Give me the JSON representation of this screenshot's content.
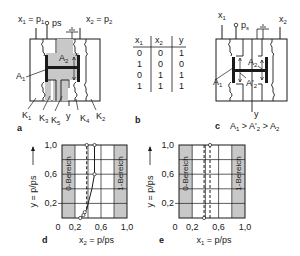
{
  "panel_a": {
    "label": "a",
    "input1": "x1 = p1",
    "input1_parts": {
      "x": "x",
      "x_sub": "1",
      "eq": " = p",
      "p_sub": "1"
    },
    "supply": "ps",
    "input2_parts": {
      "x": "x",
      "x_sub": "2",
      "eq": " = p",
      "p_sub": "2"
    },
    "area_A1": {
      "base": "A",
      "sub": "1"
    },
    "area_A2": {
      "base": "A",
      "sub": "2"
    },
    "chambers": [
      {
        "base": "K",
        "sub": "1"
      },
      {
        "base": "K",
        "sub": "3"
      },
      {
        "base": "K",
        "sub": "5"
      },
      {
        "base": "y",
        "sub": ""
      },
      {
        "base": "K",
        "sub": "4"
      },
      {
        "base": "K",
        "sub": "2"
      }
    ],
    "colors": {
      "fill": "#c8c8c8",
      "line": "#1a1a1a"
    }
  },
  "panel_b": {
    "label": "b",
    "table": {
      "headers": [
        {
          "base": "x",
          "sub": "1"
        },
        {
          "base": "x",
          "sub": "2"
        },
        {
          "base": "y",
          "sub": ""
        }
      ],
      "rows": [
        [
          "0",
          "0",
          "1"
        ],
        [
          "1",
          "0",
          "0"
        ],
        [
          "0",
          "1",
          "1"
        ],
        [
          "1",
          "1",
          "1"
        ]
      ]
    }
  },
  "panel_c": {
    "label": "c",
    "input1": {
      "base": "x",
      "sub": "1"
    },
    "supply": {
      "base": "p",
      "sub": "s"
    },
    "input2": {
      "base": "x",
      "sub": "2"
    },
    "output": "y",
    "area_A1": {
      "base": "A",
      "sub": "1"
    },
    "area_A2": {
      "base": "A",
      "sub": "2"
    },
    "area_A2p": {
      "base": "A'",
      "sub": "2"
    },
    "caption": "A1 > A'2 > A2",
    "caption_parts": [
      "A",
      "1",
      " > A'",
      "2",
      " > A",
      "2"
    ]
  },
  "chart_data": [
    {
      "id": "d",
      "type": "line",
      "title": "",
      "panel_label": "d",
      "xlabel": "x2 = p/ps",
      "xlabel_parts": {
        "base": "x",
        "sub": "2",
        "rest": " = p/ps"
      },
      "ylabel": "y = p/ps",
      "xlim": [
        0,
        1.0
      ],
      "ylim": [
        0,
        1.0
      ],
      "x_ticks": [
        "0",
        "0,2",
        "0,6",
        "1,0"
      ],
      "y_ticks": [
        "0,2",
        "0,6",
        "1,0"
      ],
      "grid": true,
      "regions": [
        {
          "label": "0-Bereich",
          "x_range": [
            0.0,
            0.2
          ],
          "color": "#c8c8c8"
        },
        {
          "label": "1-Bereich",
          "x_range": [
            0.8,
            1.0
          ],
          "color": "#c8c8c8"
        }
      ],
      "series": [
        {
          "name": "rising",
          "style": "solid",
          "x": [
            0.28,
            0.33,
            0.38,
            0.46,
            0.5,
            0.5
          ],
          "y": [
            0.0,
            0.04,
            0.12,
            0.4,
            0.6,
            1.0
          ]
        },
        {
          "name": "hysteresis-left",
          "style": "dashed",
          "x": [
            0.38,
            0.38
          ],
          "y": [
            0.12,
            1.0
          ]
        },
        {
          "name": "hysteresis-right",
          "style": "dashed",
          "x": [
            0.5,
            0.5
          ],
          "y": [
            0.6,
            1.0
          ]
        }
      ],
      "markers": [
        {
          "x": 0.28,
          "y": 0.0
        },
        {
          "x": 0.33,
          "y": 0.04
        },
        {
          "x": 0.35,
          "y": 0.08
        },
        {
          "x": 0.5,
          "y": 0.6
        },
        {
          "x": 0.38,
          "y": 1.0
        },
        {
          "x": 0.5,
          "y": 1.0
        }
      ]
    },
    {
      "id": "e",
      "type": "line",
      "title": "",
      "panel_label": "e",
      "xlabel": "x1 = p/ps",
      "xlabel_parts": {
        "base": "x",
        "sub": "1",
        "rest": " = p/ps"
      },
      "ylabel": "y = p/ps",
      "xlim": [
        0,
        1.0
      ],
      "ylim": [
        0,
        1.0
      ],
      "x_ticks": [
        "0",
        "0,2",
        "0,6",
        "1,0"
      ],
      "y_ticks": [
        "0,2",
        "0,6",
        "1,0"
      ],
      "grid": true,
      "regions": [
        {
          "label": "0-Bereich",
          "x_range": [
            0.0,
            0.2
          ],
          "color": "#c8c8c8"
        },
        {
          "label": "1-Bereich",
          "x_range": [
            0.8,
            1.0
          ],
          "color": "#c8c8c8"
        }
      ],
      "series": [
        {
          "name": "hysteresis-left",
          "style": "dashed",
          "x": [
            0.38,
            0.38
          ],
          "y": [
            0.0,
            1.0
          ]
        },
        {
          "name": "hysteresis-right",
          "style": "dashed",
          "x": [
            0.47,
            0.47
          ],
          "y": [
            0.0,
            1.0
          ]
        }
      ],
      "markers": [
        {
          "x": 0.38,
          "y": 0.0
        },
        {
          "x": 0.47,
          "y": 1.0
        }
      ]
    }
  ]
}
